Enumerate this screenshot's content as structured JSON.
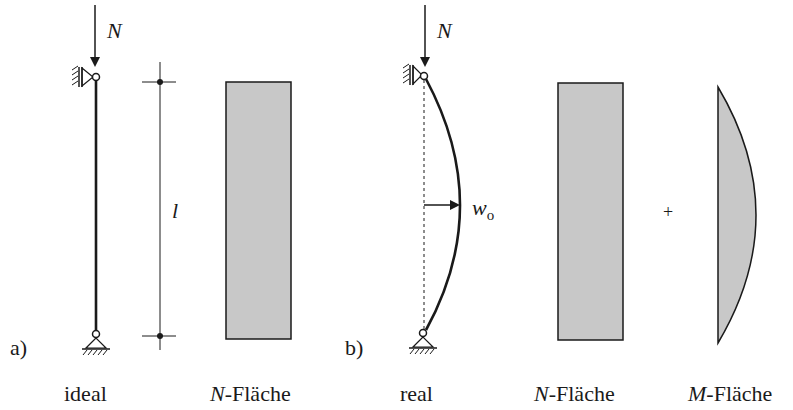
{
  "figure": {
    "part_a": {
      "marker": "a)",
      "caption": "ideal",
      "load_label": "N",
      "length_label": "l",
      "diagram_caption_italic": "N",
      "diagram_caption_rest": "-Fläche"
    },
    "part_b": {
      "marker": "b)",
      "caption": "real",
      "load_label": "N",
      "imperfection_label": "w",
      "imperfection_subscript": "o",
      "normal_diagram_caption_italic": "N",
      "normal_diagram_caption_rest": "-Fläche",
      "plus_sign": "+",
      "moment_diagram_caption_italic": "M",
      "moment_diagram_caption_rest": "-Fläche"
    },
    "colors": {
      "line": "#1a1a1a",
      "fill": "#c8c8c8"
    }
  }
}
